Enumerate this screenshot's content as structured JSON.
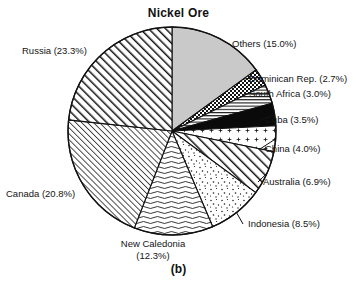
{
  "chart_data": {
    "type": "pie",
    "title": "Nickel Ore",
    "caption": "(b)",
    "xlabel": "",
    "ylabel": "",
    "legend_position": "outside-callouts",
    "grid": false,
    "units": "percent",
    "total": 100.0,
    "start_angle_deg": 0,
    "direction": "clockwise",
    "categories": [
      "Others",
      "Dominican Rep.",
      "South Africa",
      "Cuba",
      "China",
      "Australia",
      "Indonesia",
      "New Caledonia",
      "Canada",
      "Russia"
    ],
    "values": [
      15.0,
      2.7,
      3.0,
      3.5,
      4.0,
      6.9,
      8.5,
      12.3,
      20.8,
      23.3
    ],
    "slices": [
      {
        "name": "Others",
        "value": 15.0,
        "label": "Others (15.0%)",
        "pattern": "solid-gray",
        "fill": "#c9c9c9",
        "label_x": 232,
        "label_y": 38,
        "anchor": "start",
        "leader": false
      },
      {
        "name": "Dominican Rep.",
        "value": 2.7,
        "label": "Dominican Rep. (2.7%)",
        "pattern": "checkerboard",
        "fill": "#ffffff",
        "label_x": 249,
        "label_y": 73,
        "anchor": "start",
        "leader": true
      },
      {
        "name": "South Africa",
        "value": 3.0,
        "label": "South Africa (3.0%)",
        "pattern": "horizontal-lines",
        "fill": "#ffffff",
        "label_x": 249,
        "label_y": 88,
        "anchor": "start",
        "leader": true
      },
      {
        "name": "Cuba",
        "value": 3.5,
        "label": "Cuba (3.5%)",
        "pattern": "solid-black",
        "fill": "#0a0a0a",
        "label_x": 265,
        "label_y": 114,
        "anchor": "start",
        "leader": true
      },
      {
        "name": "China",
        "value": 4.0,
        "label": "China (4.0%)",
        "pattern": "sparse-dots",
        "fill": "#ffffff",
        "label_x": 265,
        "label_y": 143,
        "anchor": "start",
        "leader": true
      },
      {
        "name": "Australia",
        "value": 6.9,
        "label": "Australia (6.9%)",
        "pattern": "diagonal-hatch-right",
        "fill": "#ffffff",
        "label_x": 263,
        "label_y": 176,
        "anchor": "start",
        "leader": true
      },
      {
        "name": "Indonesia",
        "value": 8.5,
        "label": "Indonesia (8.5%)",
        "pattern": "speckle-dots",
        "fill": "#ffffff",
        "label_x": 248,
        "label_y": 218,
        "anchor": "start",
        "leader": true
      },
      {
        "name": "New Caledonia",
        "value": 12.3,
        "label": "New Caledonia (12.3%)",
        "label_line1": "New Caledonia",
        "label_line2": "(12.3%)",
        "pattern": "wavy-horizontal",
        "fill": "#ffffff",
        "label_x": 98,
        "label_y": 238,
        "anchor": "middle",
        "leader": false
      },
      {
        "name": "Canada",
        "value": 20.8,
        "label": "Canada (20.8%)",
        "pattern": "fine-diagonal-right",
        "fill": "#ffffff",
        "label_x": 6,
        "label_y": 188,
        "anchor": "start",
        "leader": false
      },
      {
        "name": "Russia",
        "value": 23.3,
        "label": "Russia (23.3%)",
        "pattern": "diagonal-hatch-right-dense",
        "fill": "#ffffff",
        "label_x": 22,
        "label_y": 45,
        "anchor": "start",
        "leader": false
      }
    ],
    "geometry": {
      "center_x": 172,
      "center_y": 131,
      "radius": 104,
      "outline_color": "#111111"
    }
  }
}
